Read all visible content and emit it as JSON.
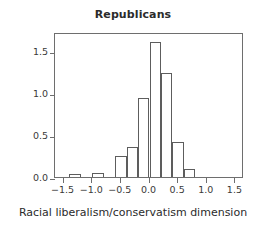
{
  "chart_data": {
    "type": "bar",
    "title": "Republicans",
    "xlabel": "Racial liberalism/conservatism dimension",
    "ylabel": "Density",
    "xlim": [
      -1.65,
      1.65
    ],
    "ylim": [
      0,
      1.72
    ],
    "xticks": [
      -1.5,
      -1.0,
      -0.5,
      0.0,
      0.5,
      1.0,
      1.5
    ],
    "xticklabels": [
      "−1.5",
      "−1.0",
      "−0.5",
      "0.0",
      "0.5",
      "1.0",
      "1.5"
    ],
    "yticks": [
      0.0,
      0.5,
      1.0,
      1.5
    ],
    "yticklabels": [
      "0.0",
      "0.5",
      "1.0",
      "1.5"
    ],
    "grid": false,
    "legend": null,
    "bin_width": 0.2,
    "bin_edges": [
      -1.4,
      -1.2,
      -1.0,
      -0.8,
      -0.6,
      -0.4,
      -0.2,
      0.0,
      0.2,
      0.4,
      0.6,
      0.8
    ],
    "bin_starts": [
      -1.4,
      -1.2,
      -1.0,
      -0.8,
      -0.6,
      -0.4,
      -0.2,
      0.0,
      0.2,
      0.4,
      0.6
    ],
    "categories": [
      "-1.4",
      "-1.2",
      "-1.0",
      "-0.8",
      "-0.6",
      "-0.4",
      "-0.2",
      "0.0",
      "0.2",
      "0.4",
      "0.6"
    ],
    "values": [
      0.03,
      0.0,
      0.05,
      0.0,
      0.25,
      0.36,
      0.94,
      1.6,
      1.23,
      0.42,
      0.1
    ],
    "bar_facecolor": "#ffffff",
    "bar_edgecolor": "#5d5d5d",
    "axis_color": "#6e6e6e",
    "text_color": "#3a3a3a"
  }
}
